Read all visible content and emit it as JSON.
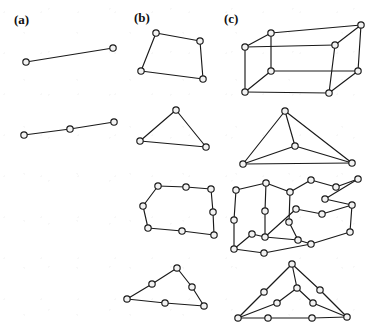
{
  "figure": {
    "caption_labels": [
      {
        "id": "a",
        "text": "(a)",
        "x": 14,
        "y": 24
      },
      {
        "id": "b",
        "text": "(b)",
        "x": 134,
        "y": 22
      },
      {
        "id": "c",
        "text": "(c)",
        "x": 224,
        "y": 23
      }
    ],
    "style": {
      "edge_color": "#1a1a1a",
      "node_fill": "#f2f2f2",
      "node_stroke": "#1a1a1a",
      "background": "#ffffff",
      "node_radius": 3.2,
      "edge_width": 1.15
    },
    "graphs": [
      {
        "name": "a-row1-single-edge",
        "column": "a",
        "row": 1,
        "description": "K2 : a single edge joining two vertices",
        "vertex_count": 2,
        "edge_count": 1,
        "nodes": [
          [
            26,
            62
          ],
          [
            113,
            48
          ]
        ],
        "edges": [
          [
            0,
            1
          ]
        ]
      },
      {
        "name": "a-row2-subdivided-edge",
        "column": "a",
        "row": 2,
        "description": "Subdivision of K2 : path with one added midpoint vertex",
        "vertex_count": 3,
        "edge_count": 2,
        "nodes": [
          [
            24,
            135
          ],
          [
            70,
            129
          ],
          [
            114,
            122
          ]
        ],
        "edges": [
          [
            0,
            1
          ],
          [
            1,
            2
          ]
        ]
      },
      {
        "name": "b-row1-quadrilateral",
        "column": "b",
        "row": 1,
        "description": "4-cycle drawn as an irregular quadrilateral",
        "vertex_count": 4,
        "edge_count": 4,
        "nodes": [
          [
            156,
            33
          ],
          [
            200,
            41
          ],
          [
            203,
            79
          ],
          [
            141,
            71
          ]
        ],
        "edges": [
          [
            0,
            1
          ],
          [
            1,
            2
          ],
          [
            2,
            3
          ],
          [
            3,
            0
          ]
        ]
      },
      {
        "name": "b-row2-triangle",
        "column": "b",
        "row": 2,
        "description": "3-cycle drawn as a triangle",
        "vertex_count": 3,
        "edge_count": 3,
        "nodes": [
          [
            176,
            110
          ],
          [
            206,
            147
          ],
          [
            140,
            141
          ]
        ],
        "edges": [
          [
            0,
            1
          ],
          [
            1,
            2
          ],
          [
            2,
            0
          ]
        ]
      },
      {
        "name": "b-row3-subdivided-quadrilateral",
        "column": "b",
        "row": 3,
        "description": "Subdivision of the 4-cycle : each of the four edges carries an extra midpoint vertex",
        "vertex_count": 8,
        "edge_count": 8,
        "nodes": [
          [
            158,
            186
          ],
          [
            186,
            187
          ],
          [
            211,
            189
          ],
          [
            213,
            212
          ],
          [
            214,
            235
          ],
          [
            182,
            231
          ],
          [
            148,
            228
          ],
          [
            143,
            206
          ]
        ],
        "edges": [
          [
            0,
            1
          ],
          [
            1,
            2
          ],
          [
            2,
            3
          ],
          [
            3,
            4
          ],
          [
            4,
            5
          ],
          [
            5,
            6
          ],
          [
            6,
            7
          ],
          [
            7,
            0
          ]
        ]
      },
      {
        "name": "b-row4-subdivided-triangle",
        "column": "b",
        "row": 4,
        "description": "Subdivision of the triangle : each of the three edges carries an extra midpoint vertex",
        "vertex_count": 6,
        "edge_count": 6,
        "nodes": [
          [
            177,
            268
          ],
          [
            192,
            287
          ],
          [
            204,
            306
          ],
          [
            165,
            303
          ],
          [
            127,
            299
          ],
          [
            152,
            284
          ]
        ],
        "edges": [
          [
            0,
            1
          ],
          [
            1,
            2
          ],
          [
            2,
            3
          ],
          [
            3,
            4
          ],
          [
            4,
            5
          ],
          [
            5,
            0
          ]
        ]
      },
      {
        "name": "c-row1-cube",
        "column": "c",
        "row": 1,
        "description": "Graph of the cube (Q3) drawn in perspective as a parallelepiped",
        "vertex_count": 8,
        "edge_count": 12,
        "nodes": [
          [
            245,
            47
          ],
          [
            271,
            33
          ],
          [
            361,
            25
          ],
          [
            335,
            45
          ],
          [
            245,
            92
          ],
          [
            271,
            71
          ],
          [
            358,
            71
          ],
          [
            329,
            93
          ]
        ],
        "edges": [
          [
            0,
            1
          ],
          [
            1,
            2
          ],
          [
            2,
            3
          ],
          [
            3,
            0
          ],
          [
            4,
            5
          ],
          [
            5,
            6
          ],
          [
            6,
            7
          ],
          [
            7,
            4
          ],
          [
            0,
            4
          ],
          [
            1,
            5
          ],
          [
            2,
            6
          ],
          [
            3,
            7
          ]
        ]
      },
      {
        "name": "c-row2-tetrahedron",
        "column": "c",
        "row": 2,
        "description": "Complete graph K4 drawn as a tetrahedron in perspective",
        "vertex_count": 4,
        "edge_count": 6,
        "nodes": [
          [
            285,
            111
          ],
          [
            295,
            146
          ],
          [
            243,
            164
          ],
          [
            352,
            163
          ]
        ],
        "edges": [
          [
            0,
            1
          ],
          [
            0,
            2
          ],
          [
            0,
            3
          ],
          [
            1,
            2
          ],
          [
            1,
            3
          ],
          [
            2,
            3
          ]
        ]
      },
      {
        "name": "c-row3-subdivided-cube",
        "column": "c",
        "row": 3,
        "description": "Subdivision of the cube graph : an extra vertex inserted in the middle of each of the twelve edges",
        "vertex_count": 20,
        "edge_count": 24,
        "nodes": [
          [
            236,
            190
          ],
          [
            266,
            183
          ],
          [
            311,
            180
          ],
          [
            358,
            179
          ],
          [
            336,
            187
          ],
          [
            234,
            220
          ],
          [
            234,
            249
          ],
          [
            265,
            211
          ],
          [
            265,
            237
          ],
          [
            352,
            205
          ],
          [
            350,
            232
          ],
          [
            322,
            214
          ],
          [
            311,
            244
          ],
          [
            290,
            192
          ],
          [
            289,
            222
          ],
          [
            264,
            253
          ],
          [
            298,
            240
          ],
          [
            325,
            199
          ],
          [
            252,
            234
          ],
          [
            296,
            209
          ]
        ],
        "edges": [
          [
            0,
            1
          ],
          [
            1,
            13
          ],
          [
            13,
            2
          ],
          [
            2,
            4
          ],
          [
            4,
            3
          ],
          [
            3,
            17
          ],
          [
            17,
            9
          ],
          [
            9,
            10
          ],
          [
            0,
            5
          ],
          [
            5,
            6
          ],
          [
            6,
            15
          ],
          [
            15,
            12
          ],
          [
            12,
            10
          ],
          [
            1,
            7
          ],
          [
            7,
            8
          ],
          [
            8,
            19
          ],
          [
            19,
            11
          ],
          [
            11,
            9
          ],
          [
            8,
            16
          ],
          [
            16,
            12
          ],
          [
            6,
            18
          ],
          [
            18,
            8
          ],
          [
            13,
            14
          ],
          [
            14,
            16
          ]
        ]
      },
      {
        "name": "c-row4-subdivided-tetrahedron",
        "column": "c",
        "row": 4,
        "description": "Subdivision of K4 : an extra vertex inserted in the middle of each of the six edges",
        "vertex_count": 10,
        "edge_count": 12,
        "nodes": [
          [
            292,
            264
          ],
          [
            264,
            292
          ],
          [
            238,
            318
          ],
          [
            320,
            290
          ],
          [
            347,
            317
          ],
          [
            297,
            288
          ],
          [
            277,
            303
          ],
          [
            313,
            303
          ],
          [
            268,
            318
          ],
          [
            312,
            318
          ]
        ],
        "edges": [
          [
            0,
            1
          ],
          [
            1,
            2
          ],
          [
            0,
            3
          ],
          [
            3,
            4
          ],
          [
            0,
            5
          ],
          [
            5,
            6
          ],
          [
            6,
            2
          ],
          [
            5,
            7
          ],
          [
            7,
            4
          ],
          [
            2,
            8
          ],
          [
            8,
            9
          ],
          [
            9,
            4
          ]
        ]
      }
    ]
  }
}
